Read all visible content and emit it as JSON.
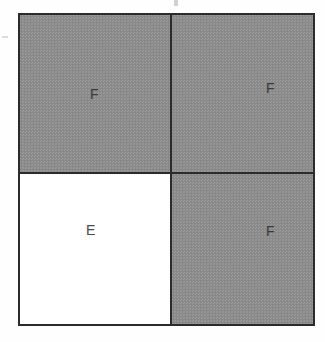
{
  "figure": {
    "type": "grid-diagram",
    "title": "",
    "rows": 2,
    "columns": 2,
    "outline_color": "#2b2b2b",
    "shaded_color": "#8d8d8d",
    "empty_color": "#ffffff",
    "label_color": "#3a3a3a"
  },
  "cells": [
    {
      "position": "top-left",
      "label": "F",
      "fill": "shaded"
    },
    {
      "position": "top-right",
      "label": "F",
      "fill": "shaded"
    },
    {
      "position": "bottom-left",
      "label": "E",
      "fill": "empty"
    },
    {
      "position": "bottom-right",
      "label": "F",
      "fill": "shaded"
    }
  ],
  "artifacts": {
    "top_speck": "",
    "left_speck": ""
  }
}
